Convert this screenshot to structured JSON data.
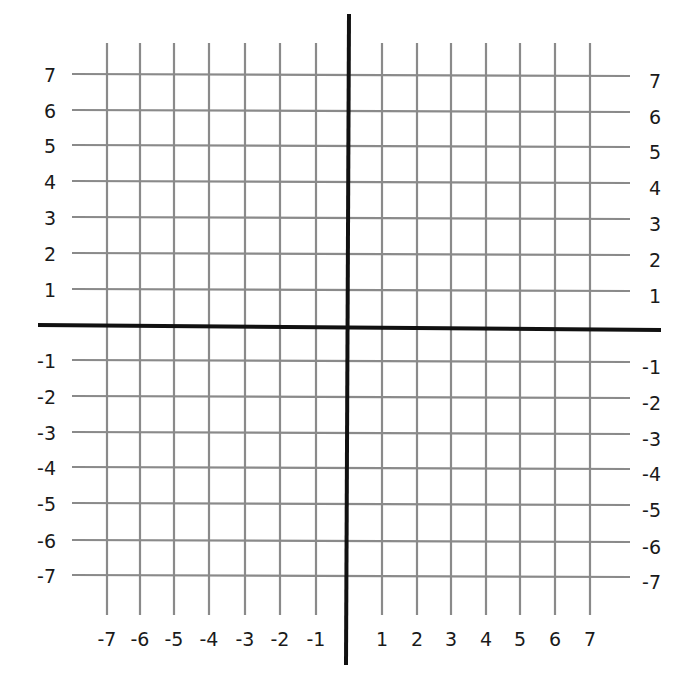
{
  "diagram": {
    "type": "coordinate-plane",
    "grid_color": "#8a8a8a",
    "axis_color": "#111111",
    "x_range": [
      -7,
      7
    ],
    "y_range": [
      -7,
      7
    ],
    "x_tick_labels": [
      "-7",
      "-6",
      "-5",
      "-4",
      "-3",
      "-2",
      "-1",
      "1",
      "2",
      "3",
      "4",
      "5",
      "6",
      "7"
    ],
    "y_tick_labels_left": [
      "7",
      "6",
      "5",
      "4",
      "3",
      "2",
      "1",
      "-1",
      "-2",
      "-3",
      "-4",
      "-5",
      "-6",
      "-7"
    ],
    "y_tick_labels_right": [
      "7",
      "6",
      "5",
      "4",
      "3",
      "2",
      "1",
      "-1",
      "-2",
      "-3",
      "-4",
      "-5",
      "-6",
      "-7"
    ]
  },
  "layout": {
    "x_pos": {
      "-7": 107,
      "-6": 140,
      "-5": 174,
      "-4": 209,
      "-3": 245,
      "-2": 280,
      "-1": 316,
      "1": 382,
      "2": 417,
      "3": 451,
      "4": 486,
      "5": 520,
      "6": 555,
      "7": 590
    },
    "y_pos": {
      "7": 74,
      "6": 110,
      "5": 145,
      "4": 181,
      "3": 217,
      "2": 253,
      "1": 289,
      "-1": 360,
      "-2": 396,
      "-3": 432,
      "-4": 467,
      "-5": 503,
      "-6": 540,
      "-7": 575
    },
    "x_axis": {
      "x1": 38,
      "y1": 325,
      "x2": 661,
      "y2": 330
    },
    "y_axis": {
      "x1": 349,
      "y1": 14,
      "x2": 346,
      "y2": 665
    },
    "vgrid_top": 43,
    "vgrid_bottom": 615,
    "hgrid_left": 72,
    "hgrid_right": 630
  }
}
